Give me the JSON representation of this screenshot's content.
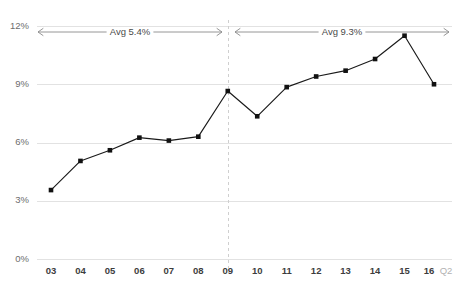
{
  "chart_data": {
    "type": "line",
    "title": "",
    "subtitle": "",
    "xlabel": "",
    "ylabel": "",
    "grid": true,
    "legend": false,
    "ylim": [
      0,
      12
    ],
    "y_ticks": [
      "0%",
      "3%",
      "6%",
      "9%",
      "12%"
    ],
    "y_tick_values": [
      0,
      3,
      6,
      9,
      12
    ],
    "categories": [
      "03",
      "04",
      "05",
      "06",
      "07",
      "08",
      "09",
      "10",
      "11",
      "12",
      "13",
      "14",
      "15",
      "16"
    ],
    "x_tick_labels": [
      "03",
      "04",
      "05",
      "06",
      "07",
      "08",
      "09",
      "10",
      "11",
      "12",
      "13",
      "14",
      "15",
      "16"
    ],
    "last_tick_suffix": "Q2",
    "series": [
      {
        "name": "",
        "values": [
          3.55,
          5.05,
          5.6,
          6.25,
          6.1,
          6.3,
          8.65,
          7.35,
          8.85,
          9.4,
          9.7,
          10.3,
          11.5,
          9.0
        ]
      }
    ],
    "annotations": [
      {
        "name": "avg-left",
        "label": "Avg 5.4%",
        "value": 5.4,
        "span_start": "03",
        "span_end": "09"
      },
      {
        "name": "avg-right",
        "label": "Avg 9.3%",
        "value": 9.3,
        "span_start": "09",
        "span_end": "16"
      }
    ],
    "divider": {
      "at_category": "09",
      "style": "dashed"
    },
    "colors": {
      "line": "#1a1a1a",
      "marker": "#111111",
      "grid": "#e2e2e2",
      "divider": "#cfcfcf",
      "annotation": "#8a8a8a",
      "axis_label": "#6d6d6d",
      "x_label": "#3d3d3d",
      "x_label_muted": "#b2b2b2",
      "background": "#ffffff"
    }
  }
}
